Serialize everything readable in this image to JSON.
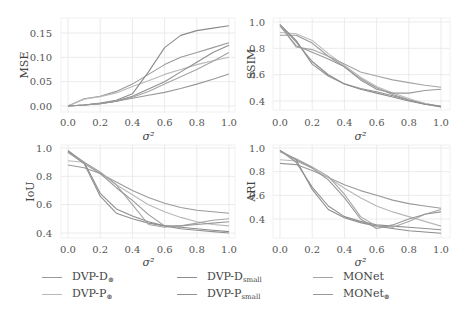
{
  "chart_data": [
    {
      "type": "line",
      "title": "",
      "xlabel": "σ²",
      "ylabel": "MSE",
      "xlim": [
        0.0,
        1.0
      ],
      "ylim": [
        -0.005,
        0.17
      ],
      "xticks": [
        "0.0",
        "0.2",
        "0.4",
        "0.6",
        "0.8",
        "1.0"
      ],
      "yticks": [
        "0.00",
        "0.05",
        "0.10",
        "0.15"
      ],
      "grid": true,
      "x": [
        0.0,
        0.1,
        0.2,
        0.3,
        0.4,
        0.5,
        0.6,
        0.7,
        0.8,
        0.9,
        1.0
      ],
      "series": [
        {
          "name": "DVP-D⊛",
          "values": [
            0.0,
            0.015,
            0.02,
            0.03,
            0.045,
            0.065,
            0.085,
            0.1,
            0.11,
            0.12,
            0.13
          ]
        },
        {
          "name": "DVP-P⊛",
          "values": [
            0.0,
            0.014,
            0.019,
            0.027,
            0.04,
            0.052,
            0.065,
            0.075,
            0.085,
            0.093,
            0.1
          ]
        },
        {
          "name": "DVP-Dsmall",
          "values": [
            0.0,
            0.002,
            0.006,
            0.012,
            0.025,
            0.07,
            0.12,
            0.145,
            0.155,
            0.16,
            0.165
          ]
        },
        {
          "name": "DVP-Psmall",
          "values": [
            0.0,
            0.002,
            0.005,
            0.01,
            0.02,
            0.035,
            0.05,
            0.07,
            0.09,
            0.11,
            0.125
          ]
        },
        {
          "name": "MONet",
          "values": [
            0.0,
            0.002,
            0.005,
            0.01,
            0.018,
            0.03,
            0.045,
            0.06,
            0.075,
            0.092,
            0.11
          ]
        },
        {
          "name": "MONet⊛",
          "values": [
            0.0,
            0.002,
            0.005,
            0.01,
            0.016,
            0.022,
            0.028,
            0.036,
            0.045,
            0.055,
            0.066
          ]
        }
      ]
    },
    {
      "type": "line",
      "title": "",
      "xlabel": "σ²",
      "ylabel": "SSIM",
      "xlim": [
        0.0,
        1.0
      ],
      "ylim": [
        0.33,
        1.01
      ],
      "xticks": [
        "0.0",
        "0.2",
        "0.4",
        "0.6",
        "0.8",
        "1.0"
      ],
      "yticks": [
        "0.4",
        "0.6",
        "0.8",
        "1.0"
      ],
      "grid": true,
      "x": [
        0.0,
        0.1,
        0.2,
        0.3,
        0.4,
        0.5,
        0.6,
        0.7,
        0.8,
        0.9,
        1.0
      ],
      "series": [
        {
          "name": "DVP-D⊛",
          "values": [
            0.9,
            0.9,
            0.84,
            0.74,
            0.66,
            0.57,
            0.5,
            0.45,
            0.41,
            0.38,
            0.36
          ]
        },
        {
          "name": "DVP-P⊛",
          "values": [
            0.92,
            0.91,
            0.86,
            0.76,
            0.67,
            0.58,
            0.51,
            0.46,
            0.42,
            0.38,
            0.355
          ]
        },
        {
          "name": "DVP-Dsmall",
          "values": [
            0.98,
            0.85,
            0.7,
            0.6,
            0.53,
            0.49,
            0.46,
            0.43,
            0.4,
            0.375,
            0.36
          ]
        },
        {
          "name": "DVP-Psmall",
          "values": [
            0.98,
            0.86,
            0.68,
            0.59,
            0.53,
            0.495,
            0.47,
            0.44,
            0.405,
            0.375,
            0.355
          ]
        },
        {
          "name": "MONet",
          "values": [
            0.98,
            0.81,
            0.79,
            0.74,
            0.68,
            0.62,
            0.59,
            0.56,
            0.54,
            0.52,
            0.505
          ]
        },
        {
          "name": "MONet⊛",
          "values": [
            0.97,
            0.82,
            0.77,
            0.72,
            0.66,
            0.56,
            0.49,
            0.46,
            0.46,
            0.48,
            0.49
          ]
        }
      ]
    },
    {
      "type": "line",
      "title": "",
      "xlabel": "σ²",
      "ylabel": "IoU",
      "xlim": [
        0.0,
        1.0
      ],
      "ylim": [
        0.38,
        1.01
      ],
      "xticks": [
        "0.0",
        "0.2",
        "0.4",
        "0.6",
        "0.8",
        "1.0"
      ],
      "yticks": [
        "0.4",
        "0.6",
        "0.8",
        "1.0"
      ],
      "grid": true,
      "x": [
        0.0,
        0.1,
        0.2,
        0.3,
        0.4,
        0.5,
        0.6,
        0.7,
        0.8,
        0.9,
        1.0
      ],
      "series": [
        {
          "name": "DVP-D⊛",
          "values": [
            0.88,
            0.86,
            0.82,
            0.76,
            0.7,
            0.65,
            0.61,
            0.58,
            0.56,
            0.55,
            0.54
          ]
        },
        {
          "name": "DVP-P⊛",
          "values": [
            0.91,
            0.9,
            0.83,
            0.74,
            0.67,
            0.6,
            0.55,
            0.51,
            0.48,
            0.46,
            0.45
          ]
        },
        {
          "name": "DVP-Dsmall",
          "values": [
            0.98,
            0.9,
            0.68,
            0.57,
            0.52,
            0.48,
            0.45,
            0.44,
            0.43,
            0.42,
            0.41
          ]
        },
        {
          "name": "DVP-Psmall",
          "values": [
            0.98,
            0.89,
            0.66,
            0.54,
            0.5,
            0.47,
            0.45,
            0.43,
            0.42,
            0.41,
            0.4
          ]
        },
        {
          "name": "MONet",
          "values": [
            0.97,
            0.9,
            0.83,
            0.74,
            0.6,
            0.46,
            0.44,
            0.45,
            0.47,
            0.49,
            0.5
          ]
        },
        {
          "name": "MONet⊛",
          "values": [
            0.97,
            0.89,
            0.82,
            0.72,
            0.63,
            0.53,
            0.45,
            0.45,
            0.46,
            0.47,
            0.48
          ]
        }
      ]
    },
    {
      "type": "line",
      "title": "",
      "xlabel": "σ²",
      "ylabel": "ARI",
      "xlim": [
        0.0,
        1.0
      ],
      "ylim": [
        0.25,
        1.01
      ],
      "xticks": [
        "0.0",
        "0.2",
        "0.4",
        "0.6",
        "0.8",
        "1.0"
      ],
      "yticks": [
        "0.4",
        "0.6",
        "0.8",
        "1.0"
      ],
      "grid": true,
      "x": [
        0.0,
        0.1,
        0.2,
        0.3,
        0.4,
        0.5,
        0.6,
        0.7,
        0.8,
        0.9,
        1.0
      ],
      "series": [
        {
          "name": "DVP-D⊛",
          "values": [
            0.87,
            0.86,
            0.81,
            0.75,
            0.69,
            0.64,
            0.6,
            0.56,
            0.53,
            0.51,
            0.49
          ]
        },
        {
          "name": "DVP-P⊛",
          "values": [
            0.9,
            0.89,
            0.83,
            0.75,
            0.66,
            0.58,
            0.51,
            0.46,
            0.42,
            0.38,
            0.34
          ]
        },
        {
          "name": "DVP-Dsmall",
          "values": [
            0.98,
            0.9,
            0.65,
            0.48,
            0.41,
            0.37,
            0.34,
            0.32,
            0.3,
            0.29,
            0.28
          ]
        },
        {
          "name": "DVP-Psmall",
          "values": [
            0.98,
            0.88,
            0.67,
            0.51,
            0.42,
            0.38,
            0.35,
            0.34,
            0.33,
            0.32,
            0.31
          ]
        },
        {
          "name": "MONet",
          "values": [
            0.97,
            0.91,
            0.84,
            0.76,
            0.61,
            0.42,
            0.34,
            0.33,
            0.38,
            0.44,
            0.48
          ]
        },
        {
          "name": "MONet⊛",
          "values": [
            0.97,
            0.9,
            0.83,
            0.73,
            0.58,
            0.4,
            0.32,
            0.35,
            0.4,
            0.44,
            0.46
          ]
        }
      ]
    }
  ],
  "legend": {
    "position": "bottom",
    "items": [
      {
        "label": "DVP-D",
        "sub": "⊛",
        "color": "#9a9a9a"
      },
      {
        "label": "DVP-P",
        "sub": "⊛",
        "color": "#b8b8b8"
      },
      {
        "label": "DVP-D",
        "sub": "small",
        "color": "#8c8c8c"
      },
      {
        "label": "DVP-P",
        "sub": "small",
        "color": "#909090"
      },
      {
        "label": "MONet",
        "sub": "",
        "color": "#a4a4a4"
      },
      {
        "label": "MONet",
        "sub": "⊛",
        "color": "#989898"
      }
    ]
  },
  "colors": {
    "series": [
      "#9a9a9a",
      "#b8b8b8",
      "#8c8c8c",
      "#909090",
      "#a4a4a4",
      "#989898"
    ],
    "grid": "#e6e6e6",
    "text": "#555555"
  }
}
